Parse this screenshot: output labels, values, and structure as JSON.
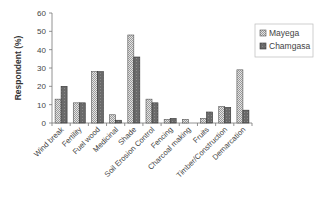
{
  "chart_data": {
    "type": "bar",
    "title": "",
    "xlabel": "",
    "ylabel": "Respondent (%)",
    "ylim": [
      0,
      60
    ],
    "yticks": [
      0,
      10,
      20,
      30,
      40,
      50,
      60
    ],
    "grid": false,
    "legend_position": "upper right",
    "categories": [
      "Wind break",
      "Fertility",
      "Fuel wood",
      "Medicinal",
      "Shade",
      "Soil Erosion Control",
      "Fencing",
      "Charcoal making",
      "Fruits",
      "Timber/Construction",
      "Demarcation"
    ],
    "series": [
      {
        "name": "Mayega",
        "color": "#c8c8c8",
        "pattern": "checkered-light",
        "values": [
          13,
          11,
          28,
          4.5,
          48,
          13,
          2,
          2,
          2.5,
          9,
          29
        ]
      },
      {
        "name": "Chamgasa",
        "color": "#6e6e6e",
        "pattern": "dark-dotted",
        "values": [
          20,
          11,
          28,
          1.5,
          36,
          11,
          2.5,
          0,
          6,
          8.5,
          7
        ]
      }
    ]
  }
}
